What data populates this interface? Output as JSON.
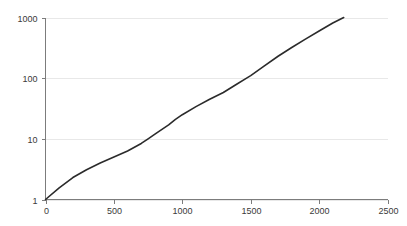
{
  "chart_data": {
    "type": "line",
    "title": "",
    "subtitle": "",
    "xlabel": "",
    "ylabel": "",
    "xlim": [
      0,
      2500
    ],
    "ylim": [
      1,
      1000
    ],
    "yscale": "log",
    "xscale": "linear",
    "grid": "horizontal",
    "legend": "none",
    "x_ticks": [
      0,
      500,
      1000,
      1500,
      2000,
      2500
    ],
    "x_tick_labels": [
      "0",
      "500",
      "1000",
      "1500",
      "2000",
      "2500"
    ],
    "y_ticks": [
      1,
      10,
      100,
      1000
    ],
    "y_tick_labels": [
      "1",
      "10",
      "100",
      "1000"
    ],
    "series": [
      {
        "name": "series-1",
        "color": "#2b2b2b",
        "x": [
          0,
          100,
          200,
          300,
          400,
          500,
          600,
          700,
          750,
          800,
          900,
          950,
          1000,
          1100,
          1200,
          1300,
          1400,
          1470,
          1500,
          1600,
          1700,
          1800,
          1900,
          2000,
          2100,
          2180
        ],
        "y": [
          1.0,
          1.55,
          2.3,
          3.1,
          4.0,
          5.0,
          6.3,
          8.4,
          10.0,
          12.0,
          17.0,
          21.0,
          25.0,
          34.0,
          45.0,
          58.0,
          80.0,
          100.0,
          110.0,
          160.0,
          230.0,
          320.0,
          440.0,
          600.0,
          810.0,
          1000.0
        ]
      }
    ]
  },
  "colors": {
    "background": "#ffffff",
    "gridline": "#e8e8e8",
    "axis": "#7c7c7c",
    "tick_text": "#3a3a3a",
    "series": "#2b2b2b"
  }
}
